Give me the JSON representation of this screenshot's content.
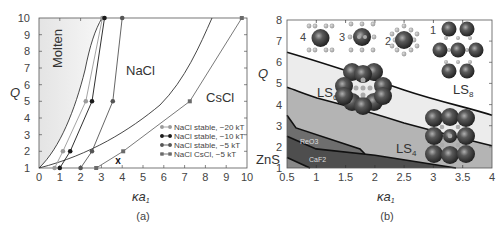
{
  "chart_data": [
    {
      "panel": "(a)",
      "type": "line",
      "xlabel": "κa1",
      "ylabel": "Q",
      "xlim": [
        0,
        10
      ],
      "ylim": [
        1,
        10
      ],
      "xticks": [
        "0",
        "1",
        "2",
        "3",
        "4",
        "5",
        "6",
        "7",
        "8",
        "9",
        "10"
      ],
      "yticks": [
        "1",
        "2",
        "3",
        "4",
        "5",
        "6",
        "7",
        "8",
        "9",
        "10"
      ],
      "region_labels": [
        "Molten",
        "NaCl",
        "CsCl"
      ],
      "series": [
        {
          "name": "NaCl stable, −20 kT",
          "color": "#9a9a9a",
          "marker": "circle",
          "x": [
            0.75,
            1.15,
            2.25,
            3.05
          ],
          "y": [
            1,
            2,
            5,
            10
          ]
        },
        {
          "name": "NaCl stable, −10 kT",
          "color": "#1a1a1a",
          "marker": "circle",
          "x": [
            1.0,
            1.5,
            2.55,
            3.15
          ],
          "y": [
            1,
            2,
            5,
            10
          ]
        },
        {
          "name": "NaCl stable, −5 kT",
          "color": "#555555",
          "marker": "circle",
          "x": [
            2.0,
            2.55,
            3.55,
            4.0
          ],
          "y": [
            1,
            2,
            5,
            10
          ]
        },
        {
          "name": "NaCl CsCl, −5 kT",
          "color": "#6a6a6a",
          "marker": "square",
          "x": [
            2.75,
            4.05,
            7.25,
            9.75
          ],
          "y": [
            1,
            2,
            5,
            10
          ]
        }
      ],
      "boundary_curves": [
        {
          "name": "molten-boundary",
          "x": [
            0,
            1,
            2,
            2.6,
            3.05
          ],
          "y": [
            1,
            2.2,
            5,
            7.7,
            10
          ]
        },
        {
          "name": "nacl-cscl-boundary",
          "x": [
            0,
            4,
            6,
            7.5,
            8.3
          ],
          "y": [
            1,
            2.8,
            5,
            7.7,
            10
          ]
        }
      ],
      "annotations": [
        {
          "text": "X",
          "x": 3.8,
          "y": 1.4
        }
      ],
      "legend_position": "lower right",
      "caption": "(a)"
    },
    {
      "panel": "(b)",
      "type": "area",
      "xlabel": "κa1",
      "ylabel": "Q",
      "xlim": [
        0.5,
        4
      ],
      "ylim": [
        1,
        8
      ],
      "xticks": [
        "0.5",
        "1",
        "1.5",
        "2",
        "2.5",
        "3",
        "3.5",
        "4"
      ],
      "yticks": [
        "1",
        "2",
        "3",
        "4",
        "5",
        "6",
        "7",
        "8"
      ],
      "regions": [
        "ZnS",
        "CaF2",
        "ReO3",
        "LS4",
        "LS6",
        "LS8"
      ],
      "boundaries": [
        {
          "name": "LS6/LS8",
          "x": [
            0.5,
            1.0,
            2.0,
            3.0,
            4.0
          ],
          "y": [
            6.5,
            6.0,
            5.05,
            4.2,
            3.5
          ]
        },
        {
          "name": "LS4/LS6",
          "x": [
            0.5,
            1.0,
            2.0,
            3.0,
            4.0
          ],
          "y": [
            4.5,
            3.95,
            2.95,
            2.3,
            1.7
          ]
        },
        {
          "name": "ReO3/LS4",
          "x": [
            0.5,
            0.75,
            1.8,
            1.95
          ],
          "y": [
            3.5,
            2.9,
            1.9,
            1.65
          ]
        },
        {
          "name": "CaF2/ReO3",
          "x": [
            0.5,
            1.0,
            2.0,
            3.4
          ],
          "y": [
            2.5,
            1.9,
            1.6,
            1.0
          ]
        },
        {
          "name": "ZnS/CaF2",
          "x": [
            0.5,
            0.9
          ],
          "y": [
            1.5,
            1.0
          ]
        }
      ],
      "inset_labels": [
        "4",
        "3",
        "2",
        "1"
      ],
      "caption": "(b)"
    }
  ],
  "panel_a": {
    "ylabel": "Q",
    "xlabel_main": "κa",
    "xlabel_sub": "1",
    "region_molten": "Molten",
    "region_nacl": "NaCl",
    "region_cscl": "CsCl",
    "marker_x": "x",
    "legend": [
      "NaCl stable, −20 kT",
      "NaCl stable, −10 kT",
      "NaCl stable, −5 kT",
      "NaCl CsCl, −5 kT"
    ],
    "caption": "(a)",
    "xticks": [
      "0",
      "1",
      "2",
      "3",
      "4",
      "5",
      "6",
      "7",
      "8",
      "9",
      "10"
    ],
    "yticks": [
      "1",
      "2",
      "3",
      "4",
      "5",
      "6",
      "7",
      "8",
      "9",
      "10"
    ]
  },
  "panel_b": {
    "ylabel": "Q",
    "xlabel_main": "κa",
    "xlabel_sub": "1",
    "label_zns": "ZnS",
    "label_caf2": "CaF2",
    "label_reo3": "ReO3",
    "label_ls4": "LS4",
    "label_ls6": "LS6",
    "label_ls8": "LS8",
    "inset_4": "4",
    "inset_3": "3",
    "inset_2": "2",
    "inset_1": "1",
    "caption": "(b)",
    "xticks": [
      "0.5",
      "1",
      "1.5",
      "2",
      "2.5",
      "3",
      "3.5",
      "4"
    ],
    "yticks": [
      "1",
      "2",
      "3",
      "4",
      "5",
      "6",
      "7",
      "8"
    ]
  }
}
